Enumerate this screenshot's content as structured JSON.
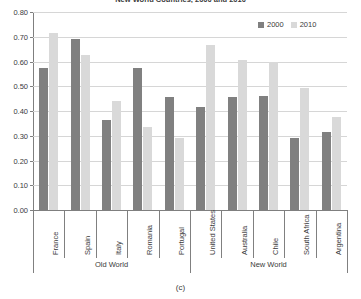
{
  "chart_data": {
    "type": "bar",
    "title": "New World Countries, 2000 and 2010",
    "caption": "(c)",
    "xlabel": "",
    "ylabel": "",
    "ylim": [
      0.0,
      0.8
    ],
    "grid": true,
    "legend_position": "top-right",
    "categories": [
      "France",
      "Spain",
      "Italy",
      "Romania",
      "Portugal",
      "United States",
      "Australia",
      "Chile",
      "South Africa",
      "Argentina"
    ],
    "groups": [
      {
        "label": "Old World",
        "categories": [
          "France",
          "Spain",
          "Italy",
          "Romania",
          "Portugal"
        ]
      },
      {
        "label": "New World",
        "categories": [
          "United States",
          "Australia",
          "Chile",
          "South Africa",
          "Argentina"
        ]
      }
    ],
    "series": [
      {
        "name": "2000",
        "color": "#808080",
        "values": [
          0.575,
          0.69,
          0.365,
          0.575,
          0.455,
          0.415,
          0.455,
          0.46,
          0.29,
          0.315
        ]
      },
      {
        "name": "2010",
        "color": "#d9d9d9",
        "values": [
          0.715,
          0.625,
          0.44,
          0.335,
          0.29,
          0.665,
          0.605,
          0.6,
          0.495,
          0.375
        ]
      }
    ],
    "ytick_labels": [
      "0.80",
      "0.70",
      "0.60",
      "0.50",
      "0.40",
      "0.30",
      "0.20",
      "0.10",
      "0.00"
    ],
    "ytick_values": [
      0.8,
      0.7,
      0.6,
      0.5,
      0.4,
      0.3,
      0.2,
      0.1,
      0.0
    ]
  }
}
